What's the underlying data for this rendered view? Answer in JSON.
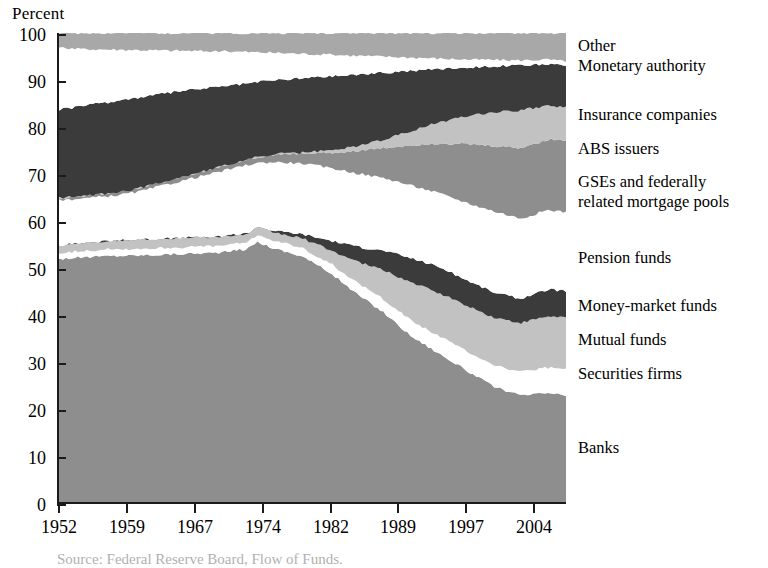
{
  "figure": {
    "axis_title": "Percent",
    "source_note": "Source: Federal Reserve Board, Flow of Funds."
  },
  "chart_data": {
    "type": "area",
    "title": "",
    "subtitle": "",
    "xlabel": "",
    "ylabel": "Percent",
    "ylim": [
      0,
      100
    ],
    "xlim": [
      1952,
      2008
    ],
    "grid": false,
    "stacked": true,
    "normalized_percent": true,
    "legend_position": "right-outside",
    "yticks": [
      0,
      10,
      20,
      30,
      40,
      50,
      60,
      70,
      80,
      90,
      100
    ],
    "ytick_labels": [
      "0",
      "10",
      "20",
      "30",
      "40",
      "50",
      "60",
      "70",
      "80",
      "90",
      "100"
    ],
    "xticks": [
      1952,
      1959,
      1967,
      1974,
      1982,
      1989,
      1997,
      2004
    ],
    "xtick_labels": [
      "1952",
      "1959",
      "1967",
      "1974",
      "1982",
      "1989",
      "1997",
      "2004"
    ],
    "x": [
      1952,
      1955,
      1958,
      1961,
      1964,
      1967,
      1970,
      1973,
      1974,
      1976,
      1979,
      1982,
      1985,
      1988,
      1991,
      1994,
      1997,
      2000,
      2003,
      2006,
      2008
    ],
    "series": [
      {
        "name": "Banks",
        "color": "#8e8e8e",
        "values": [
          52.0,
          52.3,
          52.6,
          52.6,
          52.8,
          53.0,
          53.2,
          54.0,
          55.5,
          54.0,
          52.5,
          49.0,
          44.5,
          40.5,
          35.5,
          32.0,
          28.5,
          25.0,
          23.0,
          23.5,
          23.0
        ]
      },
      {
        "name": "Securities firms",
        "color": "#ffffff",
        "values": [
          1.1,
          1.1,
          1.1,
          1.1,
          1.1,
          1.1,
          1.2,
          1.3,
          1.4,
          1.4,
          1.5,
          1.8,
          2.2,
          2.6,
          3.0,
          3.4,
          3.8,
          4.2,
          4.6,
          5.0,
          5.2
        ]
      },
      {
        "name": "Mutual funds",
        "color": "#bdbdbd",
        "values": [
          1.6,
          1.8,
          2.0,
          2.2,
          2.3,
          2.4,
          2.4,
          2.2,
          2.1,
          2.3,
          2.6,
          3.4,
          5.4,
          7.5,
          9.5,
          10.5,
          11.0,
          11.0,
          10.8,
          11.0,
          11.2
        ]
      },
      {
        "name": "Money-market funds",
        "color": "#3a3a3a"
      },
      {
        "name": "Pension funds",
        "color": "#ffffff"
      },
      {
        "name": "GSEs and federally related mortgage pools",
        "color": "#8e8e8e"
      },
      {
        "name": "ABS issuers",
        "color": "#bdbdbd"
      },
      {
        "name": "Insurance companies",
        "color": "#3a3a3a"
      },
      {
        "name": "Monetary authority",
        "color": "#ffffff"
      },
      {
        "name": "Other",
        "color": "#a9a9a9"
      }
    ],
    "legend_entries": [
      "Other",
      "Monetary authority",
      "Insurance companies",
      "ABS issuers",
      "GSEs and federally related mortgage pools",
      "Pension funds",
      "Money-market funds",
      "Mutual funds",
      "Securities firms",
      "Banks"
    ]
  },
  "legend": {
    "items": [
      {
        "label": "Other",
        "top": 36
      },
      {
        "label": "Monetary authority",
        "top": 56
      },
      {
        "label": "Insurance companies",
        "top": 105
      },
      {
        "label": "ABS issuers",
        "top": 139
      },
      {
        "label": "GSEs and federally",
        "top": 172
      },
      {
        "label": "related mortgage pools",
        "top": 192
      },
      {
        "label": "Pension funds",
        "top": 248
      },
      {
        "label": "Money-market funds",
        "top": 296
      },
      {
        "label": "Mutual funds",
        "top": 330
      },
      {
        "label": "Securities firms",
        "top": 364
      },
      {
        "label": "Banks",
        "top": 438
      }
    ]
  },
  "y_axis": {
    "ticks": [
      {
        "label": "100",
        "top": 26
      },
      {
        "label": "90",
        "top": 73
      },
      {
        "label": "80",
        "top": 120
      },
      {
        "label": "70",
        "top": 167
      },
      {
        "label": "60",
        "top": 214
      },
      {
        "label": "50",
        "top": 261
      },
      {
        "label": "40",
        "top": 308
      },
      {
        "label": "30",
        "top": 355
      },
      {
        "label": "20",
        "top": 402
      },
      {
        "label": "10",
        "top": 449
      },
      {
        "label": "0",
        "top": 496
      }
    ]
  },
  "x_axis": {
    "ticks": [
      {
        "label": "1952",
        "left": 58
      },
      {
        "label": "1959",
        "left": 126
      },
      {
        "label": "1967",
        "left": 194
      },
      {
        "label": "1974",
        "left": 262
      },
      {
        "label": "1982",
        "left": 330
      },
      {
        "label": "1989",
        "left": 397
      },
      {
        "label": "1997",
        "left": 465
      },
      {
        "label": "2004",
        "left": 533
      }
    ]
  }
}
